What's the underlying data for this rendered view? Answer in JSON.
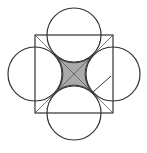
{
  "diagram": {
    "colors": {
      "stroke": "#333333",
      "shade": "#aaaaaa",
      "background": "#ffffff"
    },
    "square": {
      "x": 35,
      "y": 35,
      "size": 78
    },
    "circles": [
      {
        "name": "top",
        "cx": 74,
        "cy": 35,
        "r": 27
      },
      {
        "name": "left",
        "cx": 35,
        "cy": 74,
        "r": 27
      },
      {
        "name": "right",
        "cx": 113,
        "cy": 74,
        "r": 27
      },
      {
        "name": "bottom",
        "cx": 74,
        "cy": 113,
        "r": 27
      }
    ]
  }
}
